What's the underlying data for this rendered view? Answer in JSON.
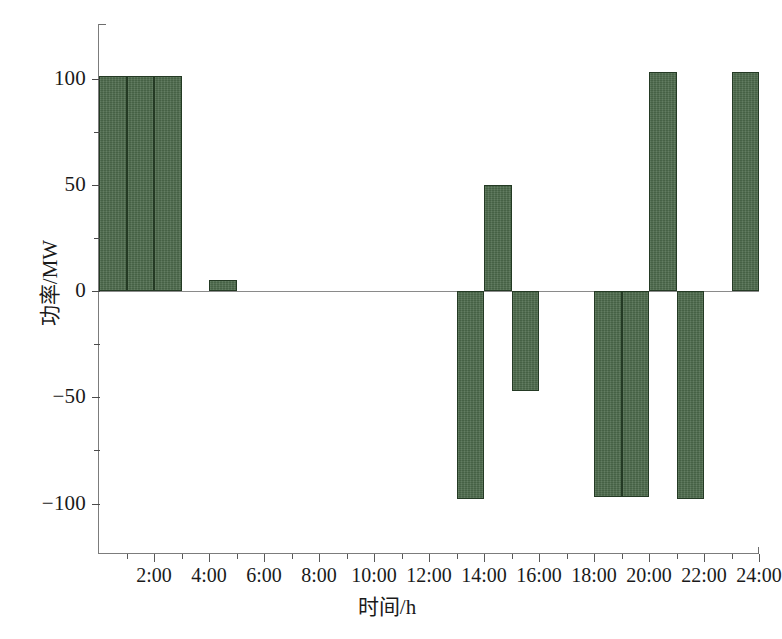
{
  "chart_data": {
    "type": "bar",
    "title": "",
    "xlabel": "时间/h",
    "ylabel": "功率/MW",
    "ylim": [
      -125,
      125
    ],
    "xlim": [
      0,
      24
    ],
    "grid": false,
    "legend": null,
    "bar_color": "#4d6b4c",
    "bar_edge_color": "#243a24",
    "y_ticks_major": [
      100,
      50,
      0,
      -50,
      -100
    ],
    "y_ticks_major_labels": [
      "100",
      "50",
      "0",
      "−50",
      "−100"
    ],
    "y_ticks_minor": [
      75,
      25,
      -25,
      -75
    ],
    "x_ticks_major": [
      2,
      4,
      6,
      8,
      10,
      12,
      14,
      16,
      18,
      20,
      22,
      24
    ],
    "x_ticks_major_labels": [
      "2:00",
      "4:00",
      "6:00",
      "8:00",
      "10:00",
      "12:00",
      "14:00",
      "16:00",
      "18:00",
      "20:00",
      "22:00",
      "24:00"
    ],
    "x_ticks_minor": [
      1,
      3,
      5,
      7,
      9,
      11,
      13,
      15,
      17,
      19,
      21,
      23
    ],
    "x_unit_label": "h",
    "y_unit_label": "MW",
    "categories": [
      "0-1",
      "1-2",
      "2-3",
      "3-4",
      "4-5",
      "5-6",
      "6-7",
      "7-8",
      "8-9",
      "9-10",
      "10-11",
      "11-12",
      "12-13",
      "13-14",
      "14-15",
      "15-16",
      "16-17",
      "17-18",
      "18-19",
      "19-20",
      "20-21",
      "21-22",
      "22-23",
      "23-24"
    ],
    "values": [
      101,
      101,
      101,
      0,
      0,
      5,
      0,
      0,
      0,
      0,
      0,
      0,
      0,
      -98,
      50,
      -47,
      0,
      0,
      -97,
      -97,
      103,
      -98,
      0,
      103
    ],
    "bars": [
      {
        "hour_start": 0,
        "hour_end": 1,
        "value": 101
      },
      {
        "hour_start": 1,
        "hour_end": 2,
        "value": 101
      },
      {
        "hour_start": 2,
        "hour_end": 3,
        "value": 101
      },
      {
        "hour_start": 4,
        "hour_end": 5,
        "value": 5
      },
      {
        "hour_start": 13,
        "hour_end": 14,
        "value": -98
      },
      {
        "hour_start": 14,
        "hour_end": 15,
        "value": 50
      },
      {
        "hour_start": 15,
        "hour_end": 16,
        "value": -47
      },
      {
        "hour_start": 18,
        "hour_end": 19,
        "value": -97
      },
      {
        "hour_start": 19,
        "hour_end": 20,
        "value": -97
      },
      {
        "hour_start": 20,
        "hour_end": 21,
        "value": 103
      },
      {
        "hour_start": 21,
        "hour_end": 22,
        "value": -98
      },
      {
        "hour_start": 23,
        "hour_end": 24,
        "value": 103
      }
    ]
  },
  "caption": ""
}
